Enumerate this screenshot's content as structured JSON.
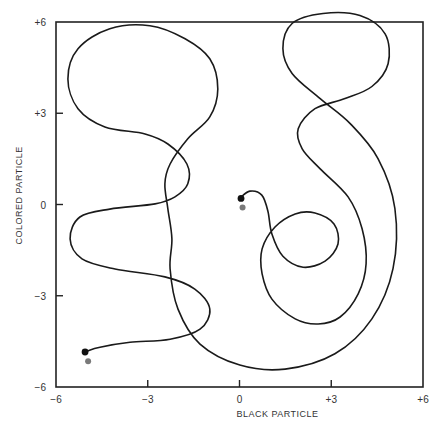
{
  "chart_data": {
    "type": "line",
    "title": "",
    "xlabel": "BLACK PARTICLE",
    "ylabel": "COLORED PARTICLE",
    "xlim": [
      -6,
      6
    ],
    "ylim": [
      -6,
      6
    ],
    "grid": false,
    "legend": "none",
    "x_ticks": [
      {
        "value": -6,
        "label": "−6"
      },
      {
        "value": -3,
        "label": "−3"
      },
      {
        "value": 0,
        "label": "0"
      },
      {
        "value": 3,
        "label": "+3"
      },
      {
        "value": 6,
        "label": "+6"
      }
    ],
    "y_ticks": [
      {
        "value": 6,
        "label": "+6"
      },
      {
        "value": 3,
        "label": "+3"
      },
      {
        "value": 0,
        "label": "0"
      },
      {
        "value": -3,
        "label": "−3"
      },
      {
        "value": -6,
        "label": "−6"
      }
    ],
    "colors": {
      "trajectory": "#1a1a1a",
      "black_particle": "#111111",
      "colored_particle": "#7a7a7a",
      "frame": "#222222"
    },
    "markers": [
      {
        "name": "start-black-particle",
        "x": 0.05,
        "y": 0.2,
        "kind": "black"
      },
      {
        "name": "start-colored-particle",
        "x": 0.1,
        "y": -0.1,
        "kind": "colored"
      },
      {
        "name": "end-black-particle",
        "x": -5.05,
        "y": -4.85,
        "kind": "black"
      },
      {
        "name": "end-colored-particle",
        "x": -4.95,
        "y": -5.15,
        "kind": "colored"
      }
    ],
    "series": [
      {
        "name": "trajectory",
        "points": [
          [
            0.01,
            0.21
          ],
          [
            0.34,
            0.44
          ],
          [
            0.73,
            0.31
          ],
          [
            0.93,
            -0.22
          ],
          [
            1.06,
            -0.97
          ],
          [
            1.42,
            -1.7
          ],
          [
            2.08,
            -2.06
          ],
          [
            2.8,
            -1.86
          ],
          [
            3.22,
            -1.3
          ],
          [
            3.09,
            -0.64
          ],
          [
            2.47,
            -0.28
          ],
          [
            1.82,
            -0.31
          ],
          [
            1.16,
            -0.74
          ],
          [
            0.74,
            -1.46
          ],
          [
            0.74,
            -2.28
          ],
          [
            1.06,
            -3.11
          ],
          [
            1.82,
            -3.76
          ],
          [
            2.57,
            -3.93
          ],
          [
            3.29,
            -3.7
          ],
          [
            3.88,
            -2.94
          ],
          [
            4.14,
            -1.95
          ],
          [
            4.01,
            -0.8
          ],
          [
            3.55,
            0.25
          ],
          [
            2.64,
            1.17
          ],
          [
            2.05,
            1.83
          ],
          [
            1.92,
            2.49
          ],
          [
            2.47,
            3.15
          ],
          [
            3.45,
            3.48
          ],
          [
            4.33,
            3.88
          ],
          [
            4.86,
            4.63
          ],
          [
            4.76,
            5.61
          ],
          [
            3.94,
            6.21
          ],
          [
            2.73,
            6.28
          ],
          [
            1.72,
            5.95
          ],
          [
            1.42,
            5.13
          ],
          [
            1.72,
            4.31
          ],
          [
            2.64,
            3.48
          ],
          [
            3.62,
            2.66
          ],
          [
            4.53,
            1.51
          ],
          [
            5.08,
            -0.13
          ],
          [
            5.02,
            -2.11
          ],
          [
            4.33,
            -3.76
          ],
          [
            3.12,
            -4.91
          ],
          [
            1.49,
            -5.41
          ],
          [
            0.01,
            -5.28
          ],
          [
            -1.29,
            -4.59
          ],
          [
            -2.01,
            -3.44
          ],
          [
            -2.27,
            -2.12
          ],
          [
            -2.21,
            -1.13
          ],
          [
            -2.34,
            -0.15
          ],
          [
            -2.44,
            0.68
          ],
          [
            -2.27,
            1.33
          ],
          [
            -1.69,
            2.16
          ],
          [
            -0.97,
            2.88
          ],
          [
            -0.71,
            3.8
          ],
          [
            -0.97,
            4.79
          ],
          [
            -1.78,
            5.45
          ],
          [
            -2.93,
            5.88
          ],
          [
            -4.24,
            5.78
          ],
          [
            -5.28,
            5.12
          ],
          [
            -5.61,
            4.13
          ],
          [
            -5.28,
            3.15
          ],
          [
            -4.4,
            2.55
          ],
          [
            -3.09,
            2.32
          ],
          [
            -2.34,
            1.99
          ],
          [
            -1.72,
            1.33
          ],
          [
            -1.69,
            0.68
          ],
          [
            -2.11,
            0.25
          ],
          [
            -2.76,
            0.02
          ],
          [
            -4.24,
            -0.15
          ],
          [
            -5.22,
            -0.41
          ],
          [
            -5.54,
            -1.13
          ],
          [
            -5.15,
            -1.79
          ],
          [
            -4.07,
            -2.12
          ],
          [
            -2.44,
            -2.38
          ],
          [
            -1.46,
            -2.78
          ],
          [
            -0.97,
            -3.44
          ],
          [
            -1.29,
            -4.1
          ],
          [
            -2.27,
            -4.43
          ],
          [
            -3.58,
            -4.53
          ],
          [
            -4.56,
            -4.69
          ],
          [
            -4.98,
            -4.82
          ]
        ]
      }
    ]
  }
}
